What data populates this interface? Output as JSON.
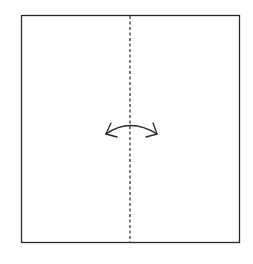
{
  "diagram": {
    "type": "origami-fold-step",
    "paper": {
      "x": 21,
      "y": 15,
      "width": 218,
      "height": 227,
      "stroke": "#2a2a2a",
      "fill": "#ffffff"
    },
    "fold_line": {
      "style": "dashed",
      "kind": "valley-fold",
      "x": 130,
      "y1": 15,
      "y2": 242,
      "stroke": "#2a2a2a"
    },
    "arrow": {
      "kind": "fold-and-unfold",
      "icon": "double-headed-curved-arrow",
      "center_x": 130,
      "y": 125,
      "left_x": 106,
      "right_x": 157,
      "stroke": "#2a2a2a"
    }
  }
}
